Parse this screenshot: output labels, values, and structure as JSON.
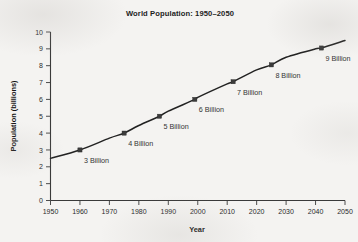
{
  "chart_data": {
    "type": "line",
    "title": "World Population: 1950–2050",
    "xlabel": "Year",
    "ylabel": "Population (billions)",
    "xlim": [
      1950,
      2050
    ],
    "ylim": [
      0,
      10
    ],
    "xticks": [
      1950,
      1960,
      1970,
      1980,
      1990,
      2000,
      2010,
      2020,
      2030,
      2040,
      2050
    ],
    "yticks": [
      0,
      1,
      2,
      3,
      4,
      5,
      6,
      7,
      8,
      9,
      10
    ],
    "grid": false,
    "legend": "none",
    "line_color": "#222222",
    "marker_color": "#3b3b3b",
    "series": [
      {
        "name": "World Population",
        "x": [
          1950,
          1960,
          1970,
          1975,
          1980,
          1987,
          1990,
          1999,
          2000,
          2010,
          2012,
          2020,
          2025,
          2030,
          2040,
          2042,
          2050
        ],
        "values": [
          2.5,
          3.0,
          3.7,
          4.0,
          4.45,
          5.0,
          5.3,
          6.0,
          6.12,
          6.92,
          7.05,
          7.75,
          8.05,
          8.5,
          9.0,
          9.05,
          9.5
        ]
      }
    ],
    "markers": [
      {
        "x": 1960,
        "y": 3.0,
        "label": "3 Billion"
      },
      {
        "x": 1975,
        "y": 4.0,
        "label": "4 Billion"
      },
      {
        "x": 1987,
        "y": 5.0,
        "label": "5 Billion"
      },
      {
        "x": 1999,
        "y": 6.0,
        "label": "6 Billion"
      },
      {
        "x": 2012,
        "y": 7.05,
        "label": "7 Billion"
      },
      {
        "x": 2025,
        "y": 8.05,
        "label": "8 Billion"
      },
      {
        "x": 2042,
        "y": 9.05,
        "label": "9 Billion"
      }
    ]
  }
}
